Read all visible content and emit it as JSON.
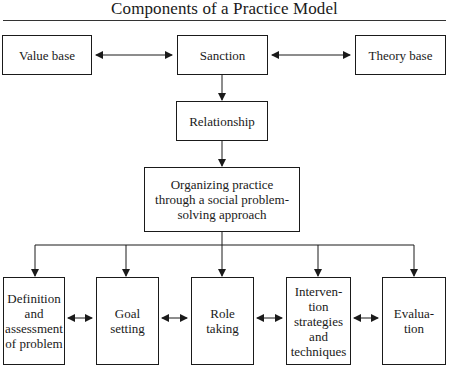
{
  "title": "Components of a Practice Model",
  "top_row": {
    "value_base": "Value base",
    "sanction": "Sanction",
    "theory_base": "Theory base"
  },
  "relationship": "Relationship",
  "organizing": "Organizing practice\nthrough a social problem-\nsolving approach",
  "bottom_row": [
    {
      "label": "Definition\nand\nassessment\nof problem"
    },
    {
      "label": "Goal\nsetting"
    },
    {
      "label": "Role\ntaking"
    },
    {
      "label": "Interven-\ntion\nstrategies\nand\ntechniques"
    },
    {
      "label": "Evalua-\ntion"
    }
  ],
  "connectors": {
    "value_base_to_sanction": "bidirectional",
    "sanction_to_theory_base": "bidirectional",
    "sanction_to_relationship": "down",
    "relationship_to_organizing": "down",
    "organizing_to_bottom_row": "branch-down",
    "bottom_row_between_boxes": "bidirectional"
  },
  "colors": {
    "line": "#1a1a1a",
    "background": "#ffffff"
  }
}
